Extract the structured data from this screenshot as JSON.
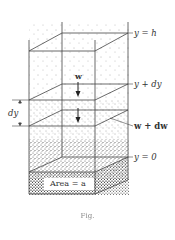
{
  "figure": {
    "labels": {
      "top": "y = h",
      "middle_upper": "y + dy",
      "middle_lower": "w + dw",
      "bottom": "y = 0",
      "weight_arrow": "w",
      "thickness": "dy",
      "base_area": "Area = a"
    },
    "caption": "Fig."
  },
  "colors": {
    "line": "#444444",
    "stipple": "#555555",
    "background": "#ffffff"
  }
}
